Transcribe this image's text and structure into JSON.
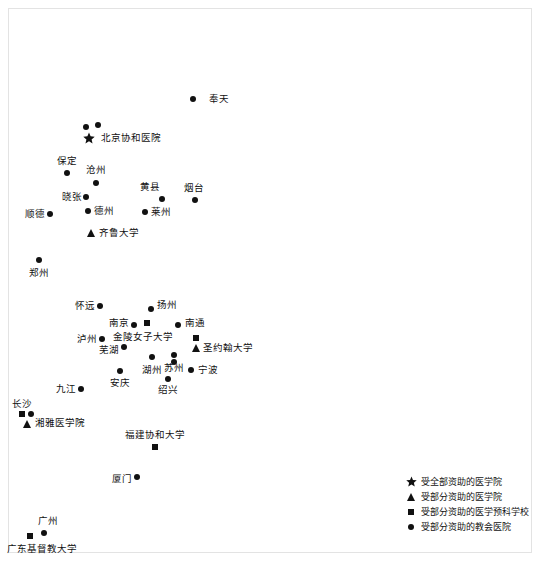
{
  "figure": {
    "background_color": "#ffffff",
    "marker_color": "#111111",
    "frame_color": "#e3e3e3"
  },
  "chart_data": {
    "type": "scatter",
    "title": "",
    "subtitle": "",
    "xlabel": "",
    "ylabel": "",
    "grid": false,
    "legend_position": "bottom-right",
    "legend": [
      {
        "marker": "star",
        "label": "受全部资助的医学院"
      },
      {
        "marker": "triangle",
        "label": "受部分资助的医学院"
      },
      {
        "marker": "square",
        "label": "受部分资助的医学预科学校"
      },
      {
        "marker": "circle",
        "label": "受部分资助的教会医院"
      }
    ],
    "points": [
      {
        "label": "奉天",
        "marker": "circle",
        "x": 193,
        "y": 99,
        "label_x": 209,
        "label_y": 99,
        "label_align": "right"
      },
      {
        "label": "",
        "marker": "circle",
        "x": 86,
        "y": 127,
        "label_x": 0,
        "label_y": 0,
        "label_align": "right"
      },
      {
        "label": "",
        "marker": "circle",
        "x": 98,
        "y": 125,
        "label_x": 0,
        "label_y": 0,
        "label_align": "right"
      },
      {
        "label": "北京协和医院",
        "marker": "star",
        "x": 89,
        "y": 138,
        "label_x": 101,
        "label_y": 138,
        "label_align": "right"
      },
      {
        "label": "保定",
        "marker": "circle",
        "x": 67,
        "y": 173,
        "label_x": 67,
        "label_y": 161,
        "label_align": "center"
      },
      {
        "label": "沧州",
        "marker": "circle",
        "x": 96,
        "y": 183,
        "label_x": 96,
        "label_y": 170,
        "label_align": "center"
      },
      {
        "label": "黄县",
        "marker": "circle",
        "x": 162,
        "y": 199,
        "label_x": 150,
        "label_y": 187,
        "label_align": "center"
      },
      {
        "label": "烟台",
        "marker": "circle",
        "x": 195,
        "y": 200,
        "label_x": 194,
        "label_y": 188,
        "label_align": "center"
      },
      {
        "label": "晓张",
        "marker": "circle",
        "x": 86,
        "y": 197,
        "label_x": 82,
        "label_y": 197,
        "label_align": "left"
      },
      {
        "label": "德州",
        "marker": "circle",
        "x": 88,
        "y": 211,
        "label_x": 94,
        "label_y": 211,
        "label_align": "right"
      },
      {
        "label": "莱州",
        "marker": "circle",
        "x": 145,
        "y": 212,
        "label_x": 151,
        "label_y": 212,
        "label_align": "right"
      },
      {
        "label": "顺德",
        "marker": "circle",
        "x": 50,
        "y": 214,
        "label_x": 45,
        "label_y": 214,
        "label_align": "left"
      },
      {
        "label": "齐鲁大学",
        "marker": "triangle",
        "x": 91,
        "y": 233,
        "label_x": 99,
        "label_y": 233,
        "label_align": "right"
      },
      {
        "label": "郑州",
        "marker": "circle",
        "x": 39,
        "y": 260,
        "label_x": 39,
        "label_y": 273,
        "label_align": "center"
      },
      {
        "label": "怀远",
        "marker": "circle",
        "x": 100,
        "y": 306,
        "label_x": 95,
        "label_y": 306,
        "label_align": "left"
      },
      {
        "label": "扬州",
        "marker": "circle",
        "x": 151,
        "y": 309,
        "label_x": 157,
        "label_y": 305,
        "label_align": "right"
      },
      {
        "label": "南京",
        "marker": "circle",
        "x": 134,
        "y": 325,
        "label_x": 129,
        "label_y": 323,
        "label_align": "left"
      },
      {
        "label": "金陵女子大学",
        "marker": "square",
        "x": 147,
        "y": 323,
        "label_x": 143,
        "label_y": 337,
        "label_align": "center"
      },
      {
        "label": "南通",
        "marker": "circle",
        "x": 178,
        "y": 325,
        "label_x": 185,
        "label_y": 323,
        "label_align": "right"
      },
      {
        "label": "泸州",
        "marker": "circle",
        "x": 102,
        "y": 339,
        "label_x": 97,
        "label_y": 339,
        "label_align": "left"
      },
      {
        "label": "芜湖",
        "marker": "circle",
        "x": 124,
        "y": 347,
        "label_x": 119,
        "label_y": 350,
        "label_align": "left"
      },
      {
        "label": "",
        "marker": "square",
        "x": 196,
        "y": 338,
        "label_x": 0,
        "label_y": 0,
        "label_align": "right"
      },
      {
        "label": "圣约翰大学",
        "marker": "triangle",
        "x": 196,
        "y": 348,
        "label_x": 203,
        "label_y": 348,
        "label_align": "right"
      },
      {
        "label": "苏州",
        "marker": "circle",
        "x": 174,
        "y": 355,
        "label_x": 174,
        "label_y": 368,
        "label_align": "center"
      },
      {
        "label": "",
        "marker": "circle",
        "x": 174,
        "y": 362,
        "label_x": 0,
        "label_y": 0,
        "label_align": "right"
      },
      {
        "label": "湖州",
        "marker": "circle",
        "x": 152,
        "y": 357,
        "label_x": 152,
        "label_y": 370,
        "label_align": "center"
      },
      {
        "label": "宁波",
        "marker": "circle",
        "x": 191,
        "y": 370,
        "label_x": 198,
        "label_y": 370,
        "label_align": "right"
      },
      {
        "label": "安庆",
        "marker": "circle",
        "x": 120,
        "y": 371,
        "label_x": 120,
        "label_y": 383,
        "label_align": "center"
      },
      {
        "label": "绍兴",
        "marker": "circle",
        "x": 168,
        "y": 379,
        "label_x": 168,
        "label_y": 390,
        "label_align": "center"
      },
      {
        "label": "九江",
        "marker": "circle",
        "x": 81,
        "y": 389,
        "label_x": 76,
        "label_y": 389,
        "label_align": "left"
      },
      {
        "label": "长沙",
        "marker": "square",
        "x": 22,
        "y": 414,
        "label_x": 22,
        "label_y": 404,
        "label_align": "center"
      },
      {
        "label": "",
        "marker": "circle",
        "x": 31,
        "y": 414,
        "label_x": 0,
        "label_y": 0,
        "label_align": "right"
      },
      {
        "label": "湘雅医学院",
        "marker": "triangle",
        "x": 27,
        "y": 424,
        "label_x": 35,
        "label_y": 423,
        "label_align": "right"
      },
      {
        "label": "福建协和大学",
        "marker": "square",
        "x": 155,
        "y": 447,
        "label_x": 155,
        "label_y": 435,
        "label_align": "center"
      },
      {
        "label": "厦门",
        "marker": "circle",
        "x": 137,
        "y": 477,
        "label_x": 132,
        "label_y": 479,
        "label_align": "left"
      },
      {
        "label": "广州",
        "marker": "circle",
        "x": 44,
        "y": 533,
        "label_x": 48,
        "label_y": 521,
        "label_align": "center"
      },
      {
        "label": "广东基督教大学",
        "marker": "square",
        "x": 30,
        "y": 536,
        "label_x": 42,
        "label_y": 549,
        "label_align": "center"
      }
    ]
  }
}
